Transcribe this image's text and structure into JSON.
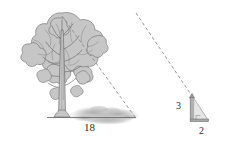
{
  "diagram": {
    "type": "similar-triangles-shadow-diagram",
    "background_color": "#ffffff",
    "ink_color": "#6e6e6e",
    "fill_color": "#c9c9c9",
    "dash_color": "#8a8a8a",
    "labels": {
      "tree_shadow_length": "18",
      "pole_height": "3",
      "pole_shadow_length": "2"
    },
    "objects": {
      "tree": "tree-illustration",
      "tree_shadow": "tree-shadow-ellipse",
      "ground_line": "ground-baseline",
      "sun_ray_tree": "dashed-sun-ray-tree",
      "pole": "vertical-pole",
      "pole_shadow": "pole-shadow-baseline",
      "sun_ray_pole": "dashed-sun-ray-pole",
      "right_angle_mark": "right-angle-marker"
    }
  }
}
